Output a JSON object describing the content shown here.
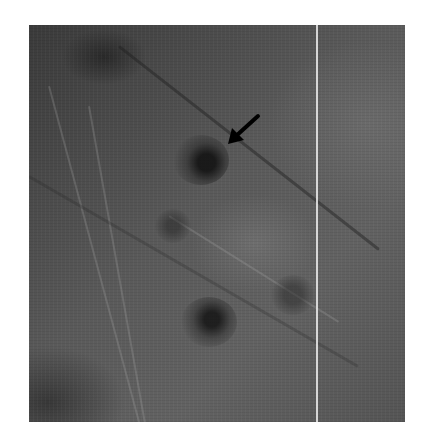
{
  "image": {
    "description": "Grayscale close-up skin photograph showing several dark round lesions along skin creases; a black arrow points to the upper lesion",
    "annotations": [
      {
        "type": "arrow",
        "color": "#000000",
        "direction": "down-left",
        "target": "upper-central lesion"
      }
    ],
    "lesions": [
      {
        "label": "indicated lesion",
        "x": 200,
        "y": 158
      },
      {
        "label": "lower lesion",
        "x": 208,
        "y": 320
      },
      {
        "label": "right lesion",
        "x": 290,
        "y": 290
      },
      {
        "label": "faint lesion",
        "x": 170,
        "y": 220
      }
    ],
    "colors": {
      "background": "#ffffff",
      "skin_dark": "#3a3a3a",
      "skin_mid": "#5a5a5a",
      "vertical_line": "#ebebeb"
    }
  }
}
